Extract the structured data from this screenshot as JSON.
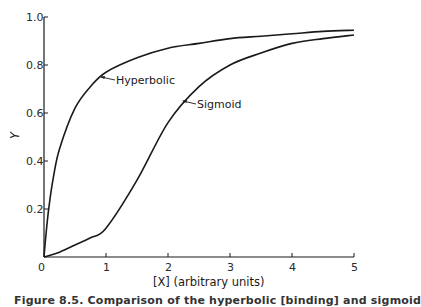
{
  "chart_data": {
    "type": "line",
    "title": "",
    "xlabel": "[X] (arbitrary units)",
    "ylabel": "Y",
    "xlim": [
      0,
      5
    ],
    "ylim": [
      0,
      1.0
    ],
    "grid": false,
    "legend_position": "inline annotations",
    "x_ticks": [
      "0",
      "1",
      "2",
      "3",
      "4",
      "5"
    ],
    "y_ticks": [
      "0.2",
      "0.4",
      "0.6",
      "0.8",
      "1.0"
    ],
    "x": [
      0,
      0.25,
      0.5,
      0.75,
      1,
      1.5,
      2,
      2.5,
      3,
      3.5,
      4,
      4.5,
      5
    ],
    "series": [
      {
        "name": "Hyperbolic",
        "values": [
          0,
          0.45,
          0.62,
          0.71,
          0.77,
          0.83,
          0.87,
          0.89,
          0.91,
          0.92,
          0.93,
          0.94,
          0.945
        ]
      },
      {
        "name": "Sigmoid",
        "values": [
          0,
          0.02,
          0.05,
          0.08,
          0.12,
          0.32,
          0.56,
          0.71,
          0.8,
          0.85,
          0.89,
          0.91,
          0.925
        ]
      }
    ],
    "annotations": [
      {
        "text": "Hyperbolic",
        "arrow_to": [
          0.85,
          0.77
        ]
      },
      {
        "text": "Sigmoid",
        "arrow_to": [
          2.2,
          0.65
        ]
      }
    ]
  },
  "labels": {
    "x_axis": "[X] (arbitrary units)",
    "y_axis": "Y",
    "hyperbolic": "Hyperbolic",
    "sigmoid": "Sigmoid",
    "caption": "Figure 8.5. Comparison of the hyperbolic [binding] and sigmoid"
  }
}
